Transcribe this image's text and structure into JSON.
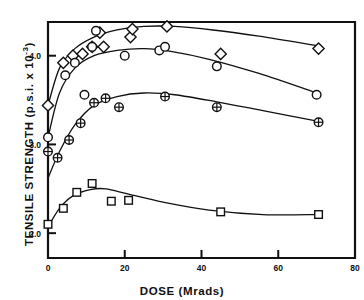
{
  "chart_data": {
    "type": "scatter",
    "title": "",
    "xlabel": "DOSE (Mrads)",
    "ylabel_text": "TENSILE STRENGTH  (p.s.i. x 10",
    "ylabel_exponent": "-3",
    "ylabel_tail": ")",
    "xlim": [
      0,
      80
    ],
    "ylim": [
      1.72,
      4.38
    ],
    "xticks": [
      0,
      20,
      40,
      60,
      80
    ],
    "xticklabels": [
      "0",
      "20",
      "40",
      "60",
      "80"
    ],
    "yticks": [
      2.0,
      3.0,
      4.0
    ],
    "yticklabels": [
      "2.0",
      "3.0",
      "4.0"
    ],
    "grid": false,
    "legend": "none",
    "axis_color": "#111111",
    "series": [
      {
        "name": "diamond-series",
        "marker": "diamond",
        "points": [
          {
            "x": 0.0,
            "y": 3.44
          },
          {
            "x": 4.0,
            "y": 3.92
          },
          {
            "x": 6.5,
            "y": 4.0
          },
          {
            "x": 9.0,
            "y": 4.02
          },
          {
            "x": 11.5,
            "y": 4.1
          },
          {
            "x": 13.5,
            "y": 4.26
          },
          {
            "x": 14.5,
            "y": 4.1
          },
          {
            "x": 21.5,
            "y": 4.21
          },
          {
            "x": 22.0,
            "y": 4.3
          },
          {
            "x": 31.0,
            "y": 4.33
          },
          {
            "x": 45.0,
            "y": 4.02
          },
          {
            "x": 70.5,
            "y": 4.08
          }
        ],
        "curve": [
          {
            "x": 0.0,
            "y": 3.44
          },
          {
            "x": 3.0,
            "y": 3.86
          },
          {
            "x": 7.0,
            "y": 4.08
          },
          {
            "x": 12.0,
            "y": 4.21
          },
          {
            "x": 18.0,
            "y": 4.29
          },
          {
            "x": 25.0,
            "y": 4.33
          },
          {
            "x": 33.0,
            "y": 4.33
          },
          {
            "x": 43.0,
            "y": 4.29
          },
          {
            "x": 55.0,
            "y": 4.22
          },
          {
            "x": 70.5,
            "y": 4.11
          }
        ]
      },
      {
        "name": "open-circle-series",
        "marker": "circle",
        "points": [
          {
            "x": 0.0,
            "y": 3.08
          },
          {
            "x": 4.5,
            "y": 3.78
          },
          {
            "x": 7.0,
            "y": 3.92
          },
          {
            "x": 9.5,
            "y": 3.56
          },
          {
            "x": 11.5,
            "y": 4.1
          },
          {
            "x": 12.5,
            "y": 4.28
          },
          {
            "x": 20.0,
            "y": 4.0
          },
          {
            "x": 29.0,
            "y": 4.06
          },
          {
            "x": 30.5,
            "y": 4.1
          },
          {
            "x": 44.0,
            "y": 3.88
          },
          {
            "x": 70.0,
            "y": 3.56
          }
        ],
        "curve": [
          {
            "x": 0.0,
            "y": 3.08
          },
          {
            "x": 3.0,
            "y": 3.58
          },
          {
            "x": 7.0,
            "y": 3.86
          },
          {
            "x": 12.0,
            "y": 4.0
          },
          {
            "x": 18.0,
            "y": 4.06
          },
          {
            "x": 25.0,
            "y": 4.08
          },
          {
            "x": 32.0,
            "y": 4.05
          },
          {
            "x": 42.0,
            "y": 3.96
          },
          {
            "x": 55.0,
            "y": 3.8
          },
          {
            "x": 70.0,
            "y": 3.58
          }
        ]
      },
      {
        "name": "crossed-circle-series",
        "marker": "crossed-circle",
        "points": [
          {
            "x": 0.0,
            "y": 2.92
          },
          {
            "x": 2.5,
            "y": 2.85
          },
          {
            "x": 5.5,
            "y": 3.05
          },
          {
            "x": 8.5,
            "y": 3.24
          },
          {
            "x": 12.0,
            "y": 3.47
          },
          {
            "x": 15.0,
            "y": 3.52
          },
          {
            "x": 18.5,
            "y": 3.42
          },
          {
            "x": 30.5,
            "y": 3.54
          },
          {
            "x": 44.0,
            "y": 3.42
          },
          {
            "x": 70.5,
            "y": 3.25
          }
        ],
        "curve": [
          {
            "x": 0.0,
            "y": 2.62
          },
          {
            "x": 3.0,
            "y": 2.92
          },
          {
            "x": 7.0,
            "y": 3.22
          },
          {
            "x": 12.0,
            "y": 3.44
          },
          {
            "x": 18.0,
            "y": 3.54
          },
          {
            "x": 25.0,
            "y": 3.58
          },
          {
            "x": 33.0,
            "y": 3.56
          },
          {
            "x": 44.0,
            "y": 3.48
          },
          {
            "x": 56.0,
            "y": 3.38
          },
          {
            "x": 70.5,
            "y": 3.26
          }
        ]
      },
      {
        "name": "square-series",
        "marker": "square",
        "points": [
          {
            "x": 0.0,
            "y": 2.1
          },
          {
            "x": 4.0,
            "y": 2.28
          },
          {
            "x": 7.5,
            "y": 2.46
          },
          {
            "x": 11.5,
            "y": 2.56
          },
          {
            "x": 16.5,
            "y": 2.36
          },
          {
            "x": 21.0,
            "y": 2.37
          },
          {
            "x": 45.0,
            "y": 2.24
          },
          {
            "x": 70.5,
            "y": 2.21
          }
        ],
        "curve": [
          {
            "x": 0.0,
            "y": 2.07
          },
          {
            "x": 3.0,
            "y": 2.28
          },
          {
            "x": 6.5,
            "y": 2.42
          },
          {
            "x": 11.0,
            "y": 2.49
          },
          {
            "x": 15.0,
            "y": 2.5
          },
          {
            "x": 21.0,
            "y": 2.44
          },
          {
            "x": 30.0,
            "y": 2.35
          },
          {
            "x": 42.0,
            "y": 2.26
          },
          {
            "x": 56.0,
            "y": 2.21
          },
          {
            "x": 70.5,
            "y": 2.21
          }
        ]
      }
    ]
  }
}
